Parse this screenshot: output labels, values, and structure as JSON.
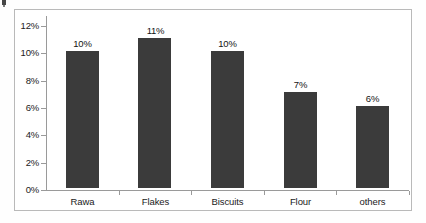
{
  "chart_data": {
    "type": "bar",
    "title": "",
    "subtitle": "",
    "xlabel": "",
    "ylabel": "",
    "categories": [
      "Rawa",
      "Flakes",
      "Biscuits",
      "Flour",
      "others"
    ],
    "values": [
      10,
      11,
      10,
      7,
      6
    ],
    "value_labels": [
      "10%",
      "11%",
      "10%",
      "7%",
      "6%"
    ],
    "ylim": [
      0,
      12
    ],
    "ytick_values": [
      0,
      2,
      4,
      6,
      8,
      10,
      12
    ],
    "ytick_labels": [
      "0%",
      "2%",
      "4%",
      "6%",
      "8%",
      "10%",
      "12%"
    ],
    "grid": false,
    "legend": "none",
    "bar_color": "#3b3b3b",
    "axis_color": "#9a9a9a",
    "border_color": "#b9b9b9",
    "background_color": "#ffffff"
  }
}
